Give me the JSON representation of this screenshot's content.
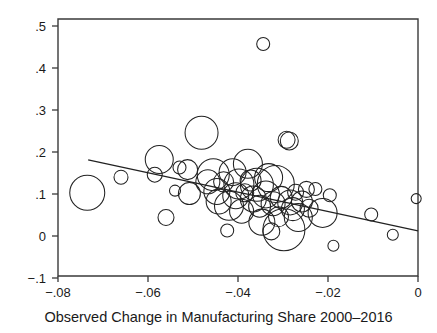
{
  "chart_data": {
    "type": "scatter",
    "title": "",
    "xlabel": "Observed Change in Manufacturing Share 2000–2016",
    "ylabel": "",
    "xlim": [
      -0.08,
      0.0
    ],
    "ylim": [
      -0.1,
      0.5
    ],
    "xticks": [
      -0.08,
      -0.06,
      -0.04,
      -0.02,
      0
    ],
    "xtick_labels": [
      "−.08",
      "−.06",
      "−.04",
      "−.02",
      "0"
    ],
    "yticks": [
      -0.1,
      0,
      0.1,
      0.2,
      0.3,
      0.4,
      0.5
    ],
    "ytick_labels": [
      "−.1",
      "0",
      ".1",
      ".2",
      ".3",
      ".4",
      ".5"
    ],
    "grid": false,
    "legend": null,
    "marker": "open-circle-weighted",
    "fit_line": {
      "type": "line",
      "x0": -0.0733,
      "y0": 0.181,
      "x1": 0.0,
      "y1": 0.012,
      "slope": -2.305,
      "intercept": 0.012
    },
    "points": [
      {
        "x": -0.0735,
        "y": 0.103,
        "r": 17.5
      },
      {
        "x": -0.066,
        "y": 0.14,
        "r": 7.0
      },
      {
        "x": -0.0575,
        "y": 0.182,
        "r": 14.0
      },
      {
        "x": -0.0585,
        "y": 0.146,
        "r": 7.5
      },
      {
        "x": -0.056,
        "y": 0.044,
        "r": 8.0
      },
      {
        "x": -0.054,
        "y": 0.108,
        "r": 5.5
      },
      {
        "x": -0.053,
        "y": 0.163,
        "r": 6.5
      },
      {
        "x": -0.0512,
        "y": 0.158,
        "r": 10.0
      },
      {
        "x": -0.0508,
        "y": 0.101,
        "r": 11.0
      },
      {
        "x": -0.0481,
        "y": 0.246,
        "r": 16.5
      },
      {
        "x": -0.0467,
        "y": 0.129,
        "r": 12.0
      },
      {
        "x": -0.0455,
        "y": 0.146,
        "r": 16.0
      },
      {
        "x": -0.0447,
        "y": 0.106,
        "r": 13.0
      },
      {
        "x": -0.0443,
        "y": 0.082,
        "r": 12.5
      },
      {
        "x": -0.0432,
        "y": 0.129,
        "r": 10.0
      },
      {
        "x": -0.0424,
        "y": 0.013,
        "r": 6.5
      },
      {
        "x": -0.042,
        "y": 0.072,
        "r": 14.5
      },
      {
        "x": -0.0412,
        "y": 0.152,
        "r": 13.5
      },
      {
        "x": -0.0405,
        "y": 0.096,
        "r": 13.0
      },
      {
        "x": -0.0398,
        "y": 0.124,
        "r": 15.0
      },
      {
        "x": -0.0392,
        "y": 0.059,
        "r": 12.0
      },
      {
        "x": -0.0385,
        "y": 0.103,
        "r": 9.0
      },
      {
        "x": -0.0378,
        "y": 0.172,
        "r": 14.5
      },
      {
        "x": -0.0372,
        "y": 0.132,
        "r": 10.5
      },
      {
        "x": -0.0366,
        "y": 0.088,
        "r": 13.0
      },
      {
        "x": -0.0358,
        "y": 0.122,
        "r": 16.5
      },
      {
        "x": -0.0352,
        "y": 0.071,
        "r": 11.0
      },
      {
        "x": -0.0347,
        "y": 0.033,
        "r": 13.0
      },
      {
        "x": -0.0344,
        "y": 0.457,
        "r": 6.5
      },
      {
        "x": -0.0338,
        "y": 0.099,
        "r": 13.5
      },
      {
        "x": -0.0332,
        "y": 0.139,
        "r": 14.0
      },
      {
        "x": -0.0326,
        "y": 0.011,
        "r": 8.5
      },
      {
        "x": -0.0322,
        "y": 0.077,
        "r": 12.0
      },
      {
        "x": -0.0316,
        "y": 0.124,
        "r": 18.5
      },
      {
        "x": -0.031,
        "y": 0.046,
        "r": 10.0
      },
      {
        "x": -0.0304,
        "y": 0.092,
        "r": 11.0
      },
      {
        "x": -0.0298,
        "y": 0.015,
        "r": 21.0
      },
      {
        "x": -0.0292,
        "y": 0.229,
        "r": 8.5
      },
      {
        "x": -0.0286,
        "y": 0.226,
        "r": 9.0
      },
      {
        "x": -0.0284,
        "y": 0.08,
        "r": 12.5
      },
      {
        "x": -0.0278,
        "y": 0.064,
        "r": 11.5
      },
      {
        "x": -0.0272,
        "y": 0.104,
        "r": 8.0
      },
      {
        "x": -0.0266,
        "y": 0.044,
        "r": 14.0
      },
      {
        "x": -0.0258,
        "y": 0.082,
        "r": 10.5
      },
      {
        "x": -0.0248,
        "y": 0.111,
        "r": 8.0
      },
      {
        "x": -0.0242,
        "y": 0.066,
        "r": 9.0
      },
      {
        "x": -0.0228,
        "y": 0.112,
        "r": 6.5
      },
      {
        "x": -0.0212,
        "y": 0.055,
        "r": 14.5
      },
      {
        "x": -0.0196,
        "y": 0.097,
        "r": 6.5
      },
      {
        "x": -0.0188,
        "y": -0.023,
        "r": 5.5
      },
      {
        "x": -0.0104,
        "y": 0.051,
        "r": 6.5
      },
      {
        "x": -0.0056,
        "y": 0.003,
        "r": 5.5
      },
      {
        "x": -0.0004,
        "y": 0.089,
        "r": 5.0
      }
    ]
  },
  "axis_title": {
    "text": "Observed Change in Manufacturing Share 2000–2016"
  }
}
